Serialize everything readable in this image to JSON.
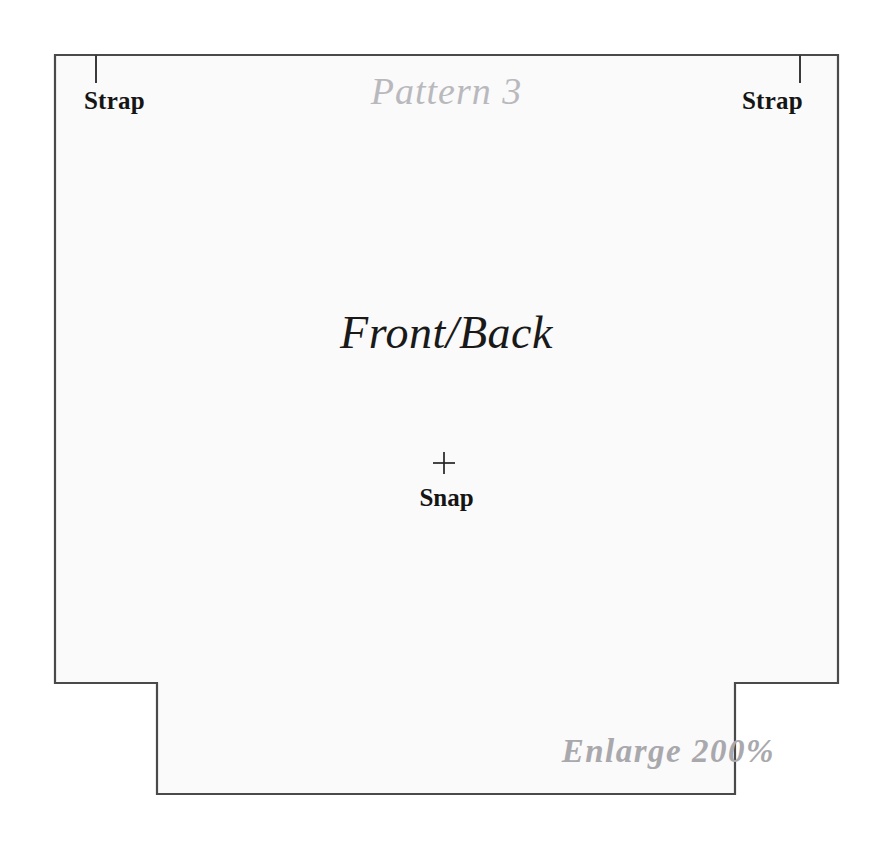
{
  "document": {
    "title": "Pattern 3",
    "kind": "sewing-pattern-sheet"
  },
  "pattern": {
    "title": "Pattern 3",
    "main_piece_label": "Front/Back",
    "snap_label": "Snap",
    "snap_marker": "plus-cross",
    "strap_left_label": "Strap",
    "strap_right_label": "Strap",
    "enlarge_note": "Enlarge 200%"
  },
  "colors": {
    "page_background": "#ffffff",
    "piece_fill": "#fafafa",
    "outline_stroke": "#4a4a4a",
    "dark_text": "#151515",
    "gray_text": "#b9b9bd",
    "enlarge_text": "#a9a9ad"
  },
  "geometry": {
    "outline_points": "55,55 838,55 838,683 735,683 735,794 157,794 157,683 55,683",
    "strap_tick_left_x": 96,
    "strap_tick_right_x": 800,
    "strap_tick_top_y": 55,
    "strap_tick_bottom_y": 83,
    "snap_center_x": 444,
    "snap_center_y": 463,
    "snap_arm_length": 11
  }
}
